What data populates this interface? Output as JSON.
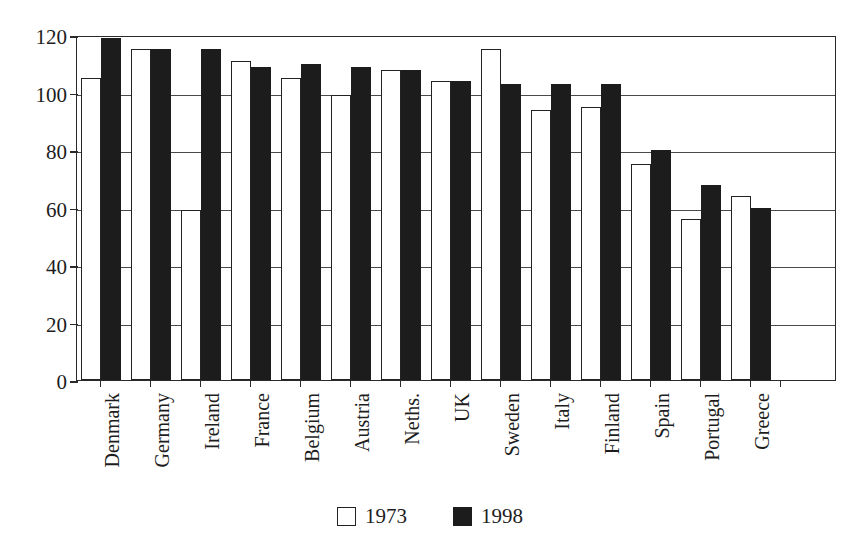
{
  "chart_data": {
    "type": "bar",
    "title": "",
    "subtitle": "",
    "xlabel": "",
    "ylabel": "",
    "ylim": [
      0,
      120
    ],
    "yticks": [
      0,
      20,
      40,
      60,
      80,
      100,
      120
    ],
    "ytick_labels": [
      "0",
      "20",
      "40",
      "60",
      "80",
      "100",
      "120"
    ],
    "grid": true,
    "grid_axis": "y",
    "legend_position": "bottom-center",
    "categories": [
      "Denmark",
      "Germany",
      "Ireland",
      "France",
      "Belgium",
      "Austria",
      "Neths.",
      "UK",
      "Sweden",
      "Italy",
      "Finland",
      "Spain",
      "Portugal",
      "Greece"
    ],
    "series": [
      {
        "name": "1973",
        "color": "#ffffff",
        "edge_color": "#222222",
        "values": [
          105,
          115,
          59,
          111,
          105,
          99,
          108,
          104,
          115,
          94,
          95,
          75,
          56,
          64
        ]
      },
      {
        "name": "1998",
        "color": "#1c1c1c",
        "edge_color": "#1c1c1c",
        "values": [
          119,
          115,
          115,
          109,
          110,
          109,
          108,
          104,
          103,
          103,
          103,
          80,
          68,
          60
        ]
      }
    ]
  },
  "legend": {
    "items": [
      {
        "label": "1973",
        "swatch": "hollow-square-swatch"
      },
      {
        "label": "1998",
        "swatch": "filled-square-swatch"
      }
    ]
  }
}
